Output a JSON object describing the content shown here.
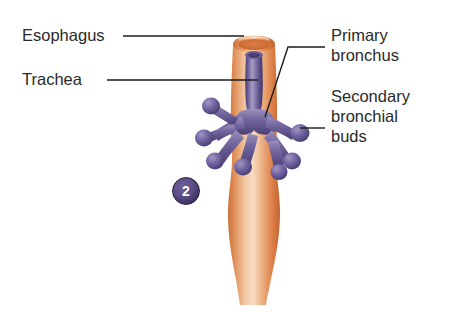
{
  "figure": {
    "background_color": "#ffffff",
    "stage_badge": {
      "number": "2",
      "fill_color": "#5b4c85",
      "ring_color": "#2b2142",
      "text_color": "#ffffff"
    },
    "colors": {
      "esophagus_orange": "#e08850",
      "esophagus_highlight": "#f6d8bc",
      "esophagus_shadow": "#c06a37",
      "esophagus_lumen": "#d2703c",
      "trachea_purple": "#6b5b9a",
      "trachea_highlight": "#a99ec6",
      "trachea_shadow": "#4a3d74",
      "leader_line": "#1d1d1d",
      "label_text": "#2a2a2a"
    },
    "labels": [
      {
        "id": "esophagus",
        "lines": [
          "Esophagus"
        ],
        "side": "left",
        "leader": "straight-horizontal"
      },
      {
        "id": "trachea",
        "lines": [
          "Trachea"
        ],
        "side": "left",
        "leader": "straight-horizontal"
      },
      {
        "id": "primary-bronchus",
        "lines": [
          "Primary",
          "bronchus"
        ],
        "side": "right",
        "leader": "angled"
      },
      {
        "id": "secondary-bronchial-buds",
        "lines": [
          "Secondary",
          "bronchial",
          "buds"
        ],
        "side": "right",
        "leader": "straight-horizontal"
      }
    ],
    "structures": [
      {
        "name": "esophagus",
        "description": "orange tube, cut open at top, bulging mid-lower section"
      },
      {
        "name": "trachea",
        "description": "purple tube running inside/in front of the esophagus"
      },
      {
        "name": "primary bronchus",
        "description": "purple branch at the bifurcation"
      },
      {
        "name": "secondary bronchial buds",
        "description": "six club-shaped purple buds radiating from the bronchi"
      }
    ]
  }
}
